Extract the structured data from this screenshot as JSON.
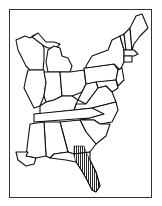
{
  "map": {
    "title": "Range map — Eastern United States",
    "region": "Eastern United States",
    "highlighted_range": {
      "description": "Hatched range covering peninsular Florida and southeastern Georgia",
      "pattern": "vertical-hatching",
      "color": "#111111"
    },
    "states_shown": [
      "Wisconsin",
      "Michigan",
      "Illinois",
      "Indiana",
      "Ohio",
      "Pennsylvania",
      "New York",
      "Vermont",
      "New Hampshire",
      "Maine",
      "Massachusetts",
      "Connecticut",
      "Rhode Island",
      "New Jersey",
      "Delaware",
      "Maryland",
      "West Virginia",
      "Virginia",
      "Kentucky",
      "Tennessee",
      "North Carolina",
      "South Carolina",
      "Georgia",
      "Alabama",
      "Mississippi",
      "Florida"
    ],
    "colors": {
      "outline": "#111111",
      "background": "#ffffff",
      "frame": "#333333"
    }
  }
}
